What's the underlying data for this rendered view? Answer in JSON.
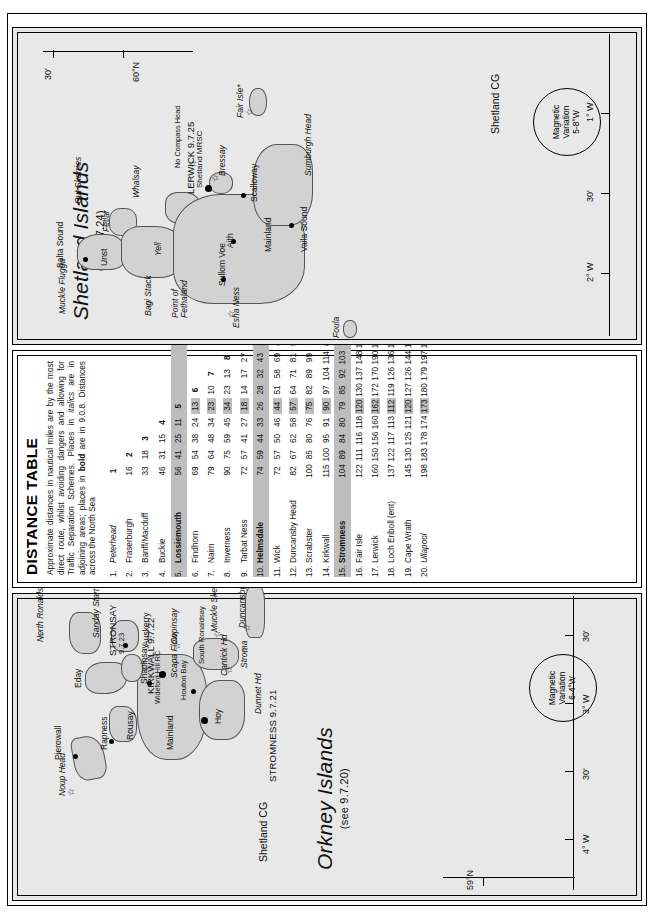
{
  "page": {
    "orientation": "rotated-90"
  },
  "distance_table": {
    "title": "DISTANCE TABLE",
    "note_plain": "Approximate distances in nautical miles are by the most direct route, whilst avoiding dangers and allowing for Traffic Separation Schemes. Places in italics are in adjoining areas; places in bold are in 9.0.8. Distances across the North Sea",
    "note_parts": {
      "p1": "Approximate distances in nautical miles are by the most direct route, whilst avoiding dangers and allowing for Traffic Separation Schemes. Places in ",
      "italics_word": "italics",
      "p2": " are in adjoining areas; places in ",
      "bold_word": "bold",
      "p3": " are in 9.0.8. Distances across the North Sea"
    },
    "places": [
      {
        "n": "1.",
        "name": "Peterhead",
        "style": "italic"
      },
      {
        "n": "2.",
        "name": "Fraserburgh",
        "style": "normal"
      },
      {
        "n": "3.",
        "name": "Banff/Macduff",
        "style": "normal"
      },
      {
        "n": "4.",
        "name": "Buckie",
        "style": "normal"
      },
      {
        "n": "5.",
        "name": "Lossiemouth",
        "style": "bold"
      },
      {
        "n": "6.",
        "name": "Findhorn",
        "style": "normal"
      },
      {
        "n": "7.",
        "name": "Nairn",
        "style": "normal"
      },
      {
        "n": "8.",
        "name": "Inverness",
        "style": "normal"
      },
      {
        "n": "9.",
        "name": "Tarbat Ness",
        "style": "normal"
      },
      {
        "n": "10.",
        "name": "Helmsdale",
        "style": "bold"
      },
      {
        "n": "11.",
        "name": "Wick",
        "style": "normal"
      },
      {
        "n": "12.",
        "name": "Duncansby Head",
        "style": "normal"
      },
      {
        "n": "13.",
        "name": "Scrabster",
        "style": "normal"
      },
      {
        "n": "14.",
        "name": "Kirkwall",
        "style": "normal"
      },
      {
        "n": "15.",
        "name": "Stromness",
        "style": "bold"
      },
      {
        "n": "16.",
        "name": "Fair Isle",
        "style": "normal"
      },
      {
        "n": "17.",
        "name": "Lerwick",
        "style": "normal"
      },
      {
        "n": "18.",
        "name": "Loch Eriboll (ent)",
        "style": "normal"
      },
      {
        "n": "19.",
        "name": "Cape Wrath",
        "style": "normal"
      },
      {
        "n": "20.",
        "name": "Ullapool",
        "style": "italic"
      }
    ],
    "column_headers": [
      "1",
      "2",
      "3",
      "4",
      "5",
      "6",
      "7",
      "8",
      "9",
      "10",
      "11",
      "12",
      "13",
      "14",
      "15",
      "16",
      "17",
      "18",
      "19",
      "20"
    ],
    "rows": [
      [
        "1"
      ],
      [
        "16",
        "2"
      ],
      [
        "33",
        "18",
        "3"
      ],
      [
        "46",
        "31",
        "15",
        "4"
      ],
      [
        "56",
        "41",
        "25",
        "11",
        "5"
      ],
      [
        "69",
        "54",
        "38",
        "24",
        "13",
        "6"
      ],
      [
        "79",
        "64",
        "48",
        "34",
        "23",
        "10",
        "7"
      ],
      [
        "90",
        "75",
        "59",
        "45",
        "34",
        "23",
        "13",
        "8"
      ],
      [
        "72",
        "57",
        "41",
        "27",
        "18",
        "14",
        "17",
        "27",
        "9"
      ],
      [
        "74",
        "59",
        "44",
        "33",
        "26",
        "28",
        "32",
        "43",
        "16",
        "10"
      ],
      [
        "72",
        "57",
        "50",
        "46",
        "44",
        "51",
        "58",
        "69",
        "42",
        "29",
        "11"
      ],
      [
        "82",
        "67",
        "62",
        "58",
        "57",
        "64",
        "71",
        "81",
        "54",
        "41",
        "13",
        "12"
      ],
      [
        "100",
        "85",
        "80",
        "76",
        "75",
        "82",
        "89",
        "99",
        "72",
        "59",
        "31",
        "18",
        "13"
      ],
      [
        "115",
        "100",
        "95",
        "91",
        "90",
        "97",
        "104",
        "114",
        "87",
        "74",
        "46",
        "34",
        "50",
        "14"
      ],
      [
        "104",
        "89",
        "84",
        "80",
        "79",
        "85",
        "92",
        "103",
        "76",
        "63",
        "35",
        "22",
        "25",
        "32",
        "15"
      ],
      [
        "122",
        "111",
        "116",
        "118",
        "120",
        "130",
        "137",
        "148",
        "121",
        "108",
        "79",
        "68",
        "85",
        "55",
        "77",
        "16"
      ],
      [
        "160",
        "150",
        "156",
        "160",
        "162",
        "172",
        "170",
        "190",
        "162",
        "148",
        "120",
        "109",
        "124",
        "95",
        "110",
        "42",
        "17"
      ],
      [
        "137",
        "122",
        "117",
        "113",
        "112",
        "119",
        "126",
        "136",
        "109",
        "96",
        "68",
        "55",
        "37",
        "80",
        "50",
        "110",
        "150",
        "18"
      ],
      [
        "145",
        "130",
        "125",
        "121",
        "120",
        "127",
        "126",
        "144",
        "117",
        "104",
        "76",
        "63",
        "47",
        "79",
        "58",
        "120",
        "155",
        "13",
        "19"
      ],
      [
        "198",
        "183",
        "178",
        "174",
        "173",
        "180",
        "179",
        "197",
        "170",
        "157",
        "129",
        "116",
        "100",
        "132",
        "111",
        "173",
        "208",
        "66",
        "53",
        "20"
      ]
    ],
    "shaded_rows": [
      5,
      10,
      15
    ],
    "shaded_cols": [
      5,
      10,
      15
    ]
  },
  "orkney_map": {
    "title": "Orkney Islands",
    "subtitle": "(see 9.7.20)",
    "coastguard": "Shetland CG",
    "magnetic_variation": {
      "l1": "Magnetic",
      "l2": "Variation",
      "l3": "6-4°W"
    },
    "coord_labels": [
      {
        "text": "59°N"
      },
      {
        "text": "4° W"
      },
      {
        "text": "30'"
      },
      {
        "text": "3° W"
      },
      {
        "text": "30'"
      }
    ],
    "ports": [
      {
        "name": "STROMNESS 9.7.21"
      },
      {
        "name": "KIRKWALL 9.7.22"
      },
      {
        "name": "STRONSAY",
        "ref": "9.7.23"
      }
    ],
    "places": [
      {
        "name": "Noup Head"
      },
      {
        "name": "Pierowall"
      },
      {
        "name": "Rapness"
      },
      {
        "name": "Rousay"
      },
      {
        "name": "Eday"
      },
      {
        "name": "Shapinsay"
      },
      {
        "name": "Auskerry"
      },
      {
        "name": "Copinsay"
      },
      {
        "name": "North Ronaldsay"
      },
      {
        "name": "Sanday Start Point"
      },
      {
        "name": "Mainland"
      },
      {
        "name": "Wideford Hill RC"
      },
      {
        "name": "Houton Bay"
      },
      {
        "name": "Scapa Flow"
      },
      {
        "name": "Hoy"
      },
      {
        "name": "Cantick Hd"
      },
      {
        "name": "South Ronaldsay"
      },
      {
        "name": "Muckle Skerry"
      },
      {
        "name": "Duncansby Hd"
      },
      {
        "name": "Stroma"
      },
      {
        "name": "Dunnet Hd"
      }
    ]
  },
  "shetland_map": {
    "title": "Shetland Islands",
    "subtitle": "(see 9.7.24)",
    "coastguard": "Shetland CG",
    "magnetic_variation": {
      "l1": "Magnetic",
      "l2": "Variation",
      "l3": "5-8°W"
    },
    "coord_labels": [
      {
        "text": "60°N"
      },
      {
        "text": "30'"
      },
      {
        "text": "2° W"
      },
      {
        "text": "1° W"
      },
      {
        "text": "30'"
      }
    ],
    "ports": [
      {
        "name": "LERWICK 9.7.25",
        "ref": "Shetland MRSC"
      }
    ],
    "places": [
      {
        "name": "Muckle Flugga"
      },
      {
        "name": "Balta Sound"
      },
      {
        "name": "Unst"
      },
      {
        "name": "Fetlar"
      },
      {
        "name": "Out Skerries"
      },
      {
        "name": "Whalsay"
      },
      {
        "name": "Bagi Stack"
      },
      {
        "name": "Point of Fethaland"
      },
      {
        "name": "Yell"
      },
      {
        "name": "Esha Ness"
      },
      {
        "name": "Sullom Voe"
      },
      {
        "name": "Aith"
      },
      {
        "name": "Mainland"
      },
      {
        "name": "Scalloway"
      },
      {
        "name": "Bressay"
      },
      {
        "name": "Vaila Sound"
      },
      {
        "name": "No Compass Head"
      },
      {
        "name": "Sumburgh Head"
      },
      {
        "name": "Fair Isle*"
      },
      {
        "name": "Foula"
      }
    ]
  }
}
